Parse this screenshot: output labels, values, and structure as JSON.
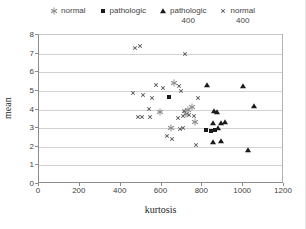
{
  "chart_data": {
    "type": "scatter",
    "title": "",
    "xlabel": "kurtosis",
    "ylabel": "mean",
    "xlim": [
      0,
      1200
    ],
    "ylim": [
      0,
      8
    ],
    "x_ticks": [
      0,
      200,
      400,
      600,
      800,
      1000,
      1200
    ],
    "y_ticks": [
      0,
      1,
      2,
      3,
      4,
      5,
      6,
      7,
      8
    ],
    "grid": "horizontal",
    "legend_position": "top",
    "series": [
      {
        "name": "normal",
        "marker": "asterisk",
        "color": "#8c8c8c",
        "points": [
          [
            592,
            3.85
          ],
          [
            648,
            3.0
          ],
          [
            663,
            5.4
          ],
          [
            718,
            3.75
          ],
          [
            731,
            4.0
          ],
          [
            748,
            4.15
          ],
          [
            766,
            3.35
          ]
        ]
      },
      {
        "name": "pathologic",
        "marker": "square",
        "color": "#1a1a1a",
        "points": [
          [
            635,
            4.65
          ],
          [
            820,
            2.9
          ],
          [
            840,
            2.85
          ],
          [
            860,
            2.9
          ]
        ]
      },
      {
        "name": "pathologic 400",
        "marker": "triangle",
        "color": "#1a1a1a",
        "points": [
          [
            825,
            5.3
          ],
          [
            1000,
            5.25
          ],
          [
            1055,
            4.2
          ],
          [
            855,
            3.9
          ],
          [
            872,
            3.88
          ],
          [
            851,
            3.3
          ],
          [
            892,
            3.3
          ],
          [
            913,
            3.32
          ],
          [
            875,
            3.0
          ],
          [
            850,
            2.25
          ],
          [
            890,
            2.3
          ],
          [
            1025,
            1.8
          ]
        ]
      },
      {
        "name": "normal 400",
        "marker": "x",
        "color": "#595959",
        "points": [
          [
            470,
            7.3
          ],
          [
            497,
            7.4
          ],
          [
            715,
            7.0
          ],
          [
            573,
            5.3
          ],
          [
            606,
            5.15
          ],
          [
            684,
            5.25
          ],
          [
            696,
            5.0
          ],
          [
            459,
            4.9
          ],
          [
            508,
            4.8
          ],
          [
            552,
            4.6
          ],
          [
            777,
            4.6
          ],
          [
            540,
            4.05
          ],
          [
            483,
            3.6
          ],
          [
            503,
            3.6
          ],
          [
            544,
            3.6
          ],
          [
            709,
            3.9
          ],
          [
            679,
            3.55
          ],
          [
            707,
            3.65
          ],
          [
            737,
            3.7
          ],
          [
            761,
            3.65
          ],
          [
            704,
            3.0
          ],
          [
            692,
            2.95
          ],
          [
            627,
            2.6
          ],
          [
            650,
            2.4
          ],
          [
            770,
            2.1
          ]
        ]
      }
    ]
  },
  "legend": {
    "items": [
      {
        "label": "normal",
        "sublabel": ""
      },
      {
        "label": "pathologic",
        "sublabel": ""
      },
      {
        "label": "pathologic",
        "sublabel": "400"
      },
      {
        "label": "normal",
        "sublabel": "400"
      }
    ]
  }
}
